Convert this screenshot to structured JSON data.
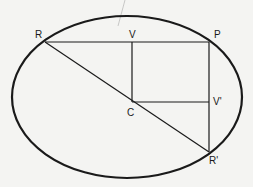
{
  "diagram": {
    "type": "ellipse-conjugate-diameters",
    "ellipse": {
      "cx": 127,
      "cy": 97,
      "rx": 115,
      "ry": 81
    },
    "points": [
      {
        "id": "R",
        "label": "R",
        "x": 45,
        "y": 42,
        "lx": 35,
        "ly": 38
      },
      {
        "id": "V",
        "label": "V",
        "x": 132,
        "y": 42,
        "lx": 129,
        "ly": 38
      },
      {
        "id": "P",
        "label": "P",
        "x": 209,
        "y": 42,
        "lx": 214,
        "ly": 38
      },
      {
        "id": "C",
        "label": "C",
        "x": 132,
        "y": 102,
        "lx": 127,
        "ly": 116
      },
      {
        "id": "V'",
        "label": "V'",
        "x": 209,
        "y": 102,
        "lx": 213,
        "ly": 105
      },
      {
        "id": "R'",
        "label": "R'",
        "x": 209,
        "y": 152,
        "lx": 209,
        "ly": 164
      }
    ],
    "segments": [
      {
        "from": "R",
        "to": "P"
      },
      {
        "from": "R",
        "to": "R'"
      },
      {
        "from": "V",
        "to": "C"
      },
      {
        "from": "C",
        "to": "V'"
      },
      {
        "from": "P",
        "to": "R'"
      }
    ],
    "colors": {
      "background": "#f4f4f2",
      "stroke": "#1a1a1a",
      "label": "#1a1a1a"
    }
  }
}
